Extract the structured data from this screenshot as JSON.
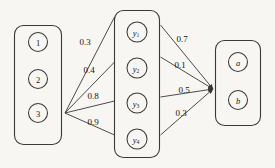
{
  "diagram": {
    "background_color": "#f7f6f2",
    "stroke_color": "#3c3a38",
    "groups": [
      {
        "name": "input-group",
        "nodes": [
          {
            "id": "n1",
            "label": "1",
            "italic": false,
            "sub": ""
          },
          {
            "id": "n2",
            "label": "2",
            "italic": false,
            "sub": ""
          },
          {
            "id": "n3",
            "label": "3",
            "italic": false,
            "sub": ""
          }
        ]
      },
      {
        "name": "hidden-group",
        "nodes": [
          {
            "id": "y1",
            "label": "y",
            "italic": true,
            "sub": "1"
          },
          {
            "id": "y2",
            "label": "y",
            "italic": true,
            "sub": "2"
          },
          {
            "id": "y3",
            "label": "y",
            "italic": true,
            "sub": "3"
          },
          {
            "id": "y4",
            "label": "y",
            "italic": true,
            "sub": "4"
          }
        ]
      },
      {
        "name": "output-group",
        "nodes": [
          {
            "id": "a",
            "label": "a",
            "italic": true,
            "sub": ""
          },
          {
            "id": "b",
            "label": "b",
            "italic": true,
            "sub": ""
          }
        ]
      }
    ],
    "edges": [
      {
        "id": "e1",
        "from": "n3",
        "to": "y1",
        "weight": "0.3"
      },
      {
        "id": "e2",
        "from": "n3",
        "to": "y2",
        "weight": "0.4"
      },
      {
        "id": "e3",
        "from": "n3",
        "to": "y3",
        "weight": "0.8"
      },
      {
        "id": "e4",
        "from": "n3",
        "to": "y4",
        "weight": "0.9"
      },
      {
        "id": "e5",
        "from": "y1",
        "to": "b",
        "weight": "0.7"
      },
      {
        "id": "e6",
        "from": "y2",
        "to": "b",
        "weight": "0.1"
      },
      {
        "id": "e7",
        "from": "y3",
        "to": "b",
        "weight": "0.5"
      },
      {
        "id": "e8",
        "from": "y4",
        "to": "b",
        "weight": "0.3"
      }
    ]
  }
}
